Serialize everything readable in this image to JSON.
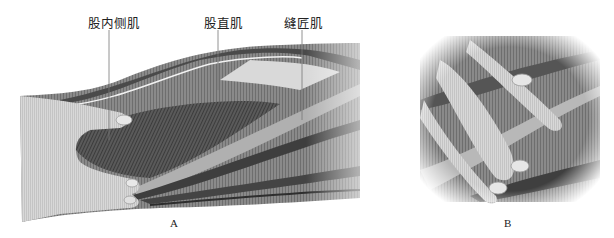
{
  "figure": {
    "panels": [
      {
        "id": "A",
        "label": "A",
        "description": "Thigh muscles with a hand palpating between the muscle bellies",
        "annotations": [
          {
            "text": "股内侧肌",
            "x": 88,
            "y": 13,
            "line_x": 109,
            "line_y1": 30,
            "line_y2": 140
          },
          {
            "text": "股直肌",
            "x": 204,
            "y": 13,
            "line_x": 218,
            "line_y1": 30,
            "line_y2": 90
          },
          {
            "text": "缝匠肌",
            "x": 284,
            "y": 13,
            "line_x": 302,
            "line_y1": 30,
            "line_y2": 120
          }
        ]
      },
      {
        "id": "B",
        "label": "B",
        "description": "Close-up of fingers pressing into muscle fibers"
      }
    ],
    "colors": {
      "background": "#ffffff",
      "muscle_dark": "#3a3a3a",
      "muscle_mid": "#7a7a7a",
      "muscle_light": "#c8c8c8",
      "skin": "#d4d4d4",
      "text": "#222222"
    }
  }
}
